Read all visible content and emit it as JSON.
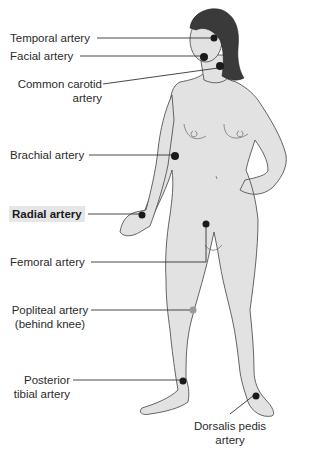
{
  "figure": {
    "colors": {
      "skin": "#e2e2e2",
      "outline": "#555555",
      "hair": "#3a3a3a",
      "pulse_point": "#1a1a1a",
      "pulse_point_hidden": "#9a9a9a",
      "leader_line": "#333333",
      "highlight_bg": "#e6e6e6"
    }
  },
  "labels": {
    "temporal": "Temporal artery",
    "facial": "Facial artery",
    "carotid_1": "Common carotid",
    "carotid_2": "artery",
    "brachial": "Brachial artery",
    "radial": "Radial artery",
    "femoral": "Femoral artery",
    "popliteal_1": "Popliteal artery",
    "popliteal_2": "(behind knee)",
    "posterior_tibial_1": "Posterior",
    "posterior_tibial_2": "tibial artery",
    "dorsalis_1": "Dorsalis pedis",
    "dorsalis_2": "artery"
  },
  "highlighted_label": "radial"
}
